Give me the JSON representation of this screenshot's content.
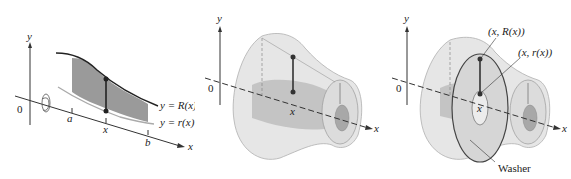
{
  "figure": {
    "panels": [
      {
        "id": "region",
        "axis_labels": {
          "y": "y",
          "x": "x",
          "origin": "0"
        },
        "ticks": {
          "a": "a",
          "x": "x",
          "b": "b"
        },
        "curves": {
          "upper": "y = R(x)",
          "lower": "y = r(x)"
        }
      },
      {
        "id": "solid",
        "axis_labels": {
          "y": "y",
          "x": "x",
          "origin": "0"
        },
        "ticks": {
          "x": "x"
        }
      },
      {
        "id": "washer",
        "axis_labels": {
          "y": "y",
          "x": "x",
          "origin": "0"
        },
        "ticks": {
          "x": "x"
        },
        "annotations": {
          "outer_point": "(x, R(x))",
          "inner_point": "(x, r(x))",
          "washer": "Washer"
        }
      }
    ],
    "colors": {
      "region_fill": "#9a9a9a",
      "solid_fill": "#e4e4e4",
      "inner_fill": "#b8b8b8",
      "line": "#333333"
    }
  }
}
